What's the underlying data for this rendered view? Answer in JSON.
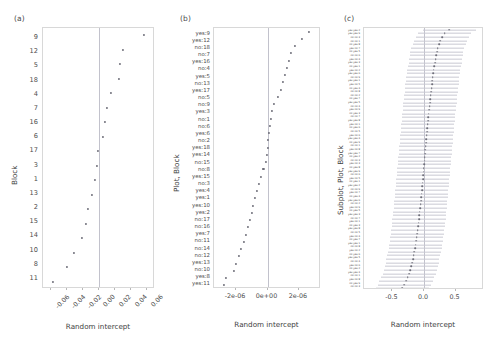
{
  "figure": {
    "panels": [
      "(a)",
      "(b)",
      "(c)"
    ],
    "xlabel": "Random intercept"
  },
  "chart_data": [
    {
      "type": "scatter",
      "panel": "(a)",
      "title": "(a)",
      "xlabel": "Random intercept",
      "ylabel": "Block",
      "xlim": [
        -0.07,
        0.07
      ],
      "xticks": [
        "-0.06",
        "-0.04",
        "-0.02",
        "0.00",
        "0.02",
        "0.04",
        "0.06"
      ],
      "xtickvals": [
        -0.06,
        -0.04,
        -0.02,
        0.0,
        0.02,
        0.04,
        0.06
      ],
      "grid": false,
      "legend": "none",
      "zero_reference": 0.0,
      "categories": [
        "9",
        "12",
        "5",
        "18",
        "4",
        "7",
        "16",
        "6",
        "17",
        "3",
        "1",
        "13",
        "2",
        "15",
        "14",
        "10",
        "8",
        "11"
      ],
      "values": [
        0.0565,
        0.0305,
        0.0262,
        0.0245,
        0.0152,
        0.0105,
        0.0078,
        0.0045,
        -0.0008,
        -0.0028,
        -0.0052,
        -0.0092,
        -0.0135,
        -0.0168,
        -0.0218,
        -0.0315,
        -0.0405,
        -0.0572
      ]
    },
    {
      "type": "scatter",
      "panel": "(b)",
      "title": "(b)",
      "xlabel": "Random intercept",
      "ylabel": "Plot, Block",
      "xlim": [
        -3.4e-06,
        3.4e-06
      ],
      "xticks": [
        "-2e-06",
        "0e+00",
        "2e-06"
      ],
      "xtickvals": [
        -2e-06,
        0,
        2e-06
      ],
      "grid": false,
      "legend": "none",
      "zero_reference": 0.0,
      "categories": [
        "yes:9",
        "yes:12",
        "no:18",
        "no:7",
        "yes:16",
        "no:4",
        "yes:5",
        "no:13",
        "yes:17",
        "no:5",
        "no:9",
        "yes:3",
        "no:1",
        "no:6",
        "yes:6",
        "no:2",
        "yes:18",
        "yes:14",
        "no:15",
        "no:8",
        "yes:15",
        "no:3",
        "yes:4",
        "yes:1",
        "yes:10",
        "yes:2",
        "no:17",
        "no:16",
        "yes:7",
        "no:11",
        "no:14",
        "no:12",
        "yes:13",
        "no:10",
        "yes:8",
        "yes:11"
      ],
      "values": [
        2.62e-06,
        2.21e-06,
        1.72e-06,
        1.5e-06,
        1.38e-06,
        1.22e-06,
        1.1e-06,
        1e-06,
        8.6e-07,
        6.4e-07,
        4.1e-07,
        3e-07,
        2.3e-07,
        1.7e-07,
        1.1e-07,
        5e-08,
        1e-08,
        -2e-08,
        -1e-07,
        -2.6e-07,
        -4.2e-07,
        -5.4e-07,
        -6.6e-07,
        -7.8e-07,
        -9e-07,
        -1e-06,
        -1.12e-06,
        -1.24e-06,
        -1.36e-06,
        -1.5e-06,
        -1.66e-06,
        -1.82e-06,
        -1.98e-06,
        -2.14e-06,
        -2.62e-06,
        -2.78e-06
      ]
    },
    {
      "type": "scatter",
      "panel": "(c)",
      "title": "(c)",
      "xlabel": "Random intercept",
      "ylabel": "Subplot, Plot, Block",
      "xlim": [
        -0.95,
        0.95
      ],
      "xticks": [
        "-0.5",
        "0.0",
        "0.5"
      ],
      "xtickvals": [
        -0.5,
        0.0,
        0.5
      ],
      "grid": false,
      "legend": "none",
      "zero_reference": 0.0,
      "errorbars": true,
      "note": "Labels rendered below legible resolution; compound yes/no level and block identifiers.",
      "categories": [
        "yes:yes:2",
        "yes:yes:9",
        "no:no:3",
        "no:no:1",
        "no:yes:8",
        "yes:no:7",
        "no:yes:5",
        "no:no:6",
        "yes:no:4",
        "yes:yes:3",
        "no:yes:1",
        "yes:no:2",
        "yes:yes:6",
        "no:no:9",
        "yes:yes:1",
        "yes:no:5",
        "no:yes:4",
        "no:no:8",
        "no:no:2",
        "no:yes:7",
        "yes:yes:5",
        "no:no:4",
        "yes:no:9",
        "no:yes:3",
        "no:no:7",
        "yes:yes:8",
        "yes:no:1",
        "no:yes:6",
        "no:no:5",
        "yes:no:6",
        "yes:yes:4",
        "no:yes:9",
        "no:no:1",
        "yes:no:8",
        "yes:yes:7",
        "no:yes:2",
        "no:no:3",
        "yes:no:3",
        "no:yes:8",
        "yes:yes:9",
        "no:no:6",
        "yes:no:5",
        "no:yes:1",
        "yes:yes:2",
        "no:no:9",
        "yes:no:7",
        "no:yes:4",
        "yes:yes:6",
        "no:no:2",
        "yes:no:9",
        "no:yes:5",
        "yes:yes:3",
        "no:no:7",
        "yes:no:1",
        "no:yes:3",
        "yes:yes:8",
        "no:no:5",
        "yes:no:4",
        "no:yes:7",
        "yes:yes:1",
        "no:no:8",
        "yes:no:2",
        "no:yes:6",
        "yes:yes:5",
        "no:no:4",
        "yes:no:6",
        "no:yes:2",
        "yes:yes:4",
        "no:no:1",
        "yes:no:8",
        "no:yes:9",
        "no:no:3"
      ],
      "values": [
        0.4,
        0.33,
        0.29,
        0.26,
        0.24,
        0.22,
        0.205,
        0.195,
        0.185,
        0.175,
        0.165,
        0.155,
        0.148,
        0.141,
        0.134,
        0.127,
        0.12,
        0.113,
        0.107,
        0.101,
        0.095,
        0.089,
        0.083,
        0.077,
        0.071,
        0.065,
        0.059,
        0.053,
        0.048,
        0.043,
        0.038,
        0.033,
        0.028,
        0.023,
        0.018,
        0.013,
        0.008,
        0.003,
        -0.002,
        -0.007,
        -0.012,
        -0.017,
        -0.022,
        -0.027,
        -0.032,
        -0.037,
        -0.042,
        -0.048,
        -0.054,
        -0.06,
        -0.066,
        -0.072,
        -0.079,
        -0.086,
        -0.093,
        -0.1,
        -0.108,
        -0.116,
        -0.124,
        -0.133,
        -0.142,
        -0.152,
        -0.163,
        -0.175,
        -0.188,
        -0.202,
        -0.218,
        -0.236,
        -0.258,
        -0.285,
        -0.312,
        -0.345
      ],
      "errors": [
        0.42,
        0.42,
        0.42,
        0.42,
        0.42,
        0.42,
        0.42,
        0.42,
        0.42,
        0.42,
        0.42,
        0.42,
        0.42,
        0.42,
        0.42,
        0.42,
        0.42,
        0.42,
        0.42,
        0.42,
        0.42,
        0.42,
        0.42,
        0.42,
        0.42,
        0.42,
        0.42,
        0.42,
        0.42,
        0.42,
        0.42,
        0.42,
        0.42,
        0.42,
        0.42,
        0.42,
        0.42,
        0.42,
        0.42,
        0.42,
        0.42,
        0.42,
        0.42,
        0.42,
        0.42,
        0.42,
        0.42,
        0.42,
        0.42,
        0.42,
        0.42,
        0.42,
        0.42,
        0.42,
        0.42,
        0.42,
        0.42,
        0.42,
        0.42,
        0.42,
        0.42,
        0.42,
        0.42,
        0.42,
        0.42,
        0.42,
        0.42,
        0.42,
        0.42,
        0.42,
        0.42,
        0.42
      ]
    }
  ]
}
